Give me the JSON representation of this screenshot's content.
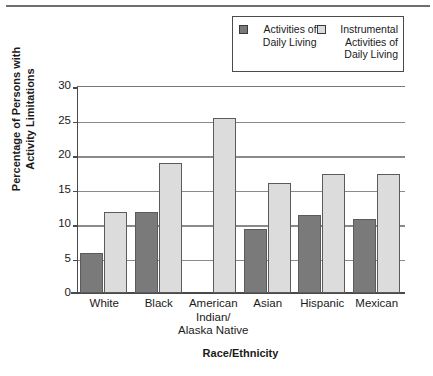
{
  "chart_data": {
    "type": "bar",
    "title": "",
    "xlabel": "Race/Ethnicity",
    "ylabel": "Percentage of Persons with\nActivity Limitations",
    "categories": [
      "White",
      "Black",
      "American\nIndian/\nAlaska Native",
      "Asian",
      "Hispanic",
      "Mexican"
    ],
    "series": [
      {
        "name": "Activities of\nDaily Living",
        "color": "#7a7a7a",
        "values": [
          5.8,
          11.8,
          null,
          9.3,
          11.3,
          10.7
        ]
      },
      {
        "name": "Instrumental\nActivities of\nDaily Living",
        "color": "#dcdcdc",
        "values": [
          11.8,
          18.8,
          25.3,
          15.9,
          17.2,
          17.2
        ]
      }
    ],
    "ylim": [
      0,
      30
    ],
    "yticks": [
      0,
      5,
      10,
      15,
      20,
      25,
      30
    ],
    "ytick_labels": [
      "0",
      "5",
      "10",
      "15",
      "20",
      "25",
      "30"
    ],
    "grid": true,
    "legend_position": "top-right"
  },
  "legend": {
    "entries": [
      {
        "label": "Activities of\nDaily Living",
        "swatch": "dark-gray-swatch"
      },
      {
        "label": "Instrumental\nActivities of\nDaily Living",
        "swatch": "light-gray-swatch"
      }
    ]
  },
  "axes": {
    "y_title": "Percentage of Persons with\nActivity Limitations",
    "x_title": "Race/Ethnicity"
  },
  "colors": {
    "series_dark": "#7a7a7a",
    "series_light": "#dcdcdc",
    "axis": "#4a4a4a",
    "gridline": "#8a8a8a",
    "background": "#ffffff"
  }
}
